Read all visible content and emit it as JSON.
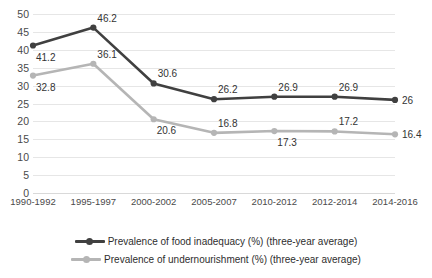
{
  "chart_data": {
    "type": "line",
    "title": "",
    "xlabel": "",
    "ylabel": "",
    "ylim": [
      0,
      50
    ],
    "ystep": 5,
    "grid": true,
    "legend_position": "bottom",
    "yticks": [
      "50",
      "45",
      "40",
      "35",
      "30",
      "25",
      "20",
      "15",
      "10",
      "5",
      "0"
    ],
    "categories": [
      "1990-1992",
      "1995-1997",
      "2000-2002",
      "2005-2007",
      "2010-2012",
      "2012-2014",
      "2014-2016"
    ],
    "series": [
      {
        "name": "Prevalence of food inadequacy (%) (three-year average)",
        "color": "#404040",
        "values": [
          41.2,
          46.2,
          30.6,
          26.2,
          26.9,
          26.9,
          26
        ],
        "labels": [
          "41.2",
          "46.2",
          "30.6",
          "26.2",
          "26.9",
          "26.9",
          "26"
        ],
        "label_positions": [
          "below",
          "above",
          "above",
          "above",
          "above",
          "above",
          "right"
        ]
      },
      {
        "name": "Prevalence of undernourishment (%) (three-year average)",
        "color": "#b5b5b5",
        "values": [
          32.8,
          36.1,
          20.6,
          16.8,
          17.3,
          17.2,
          16.4
        ],
        "labels": [
          "32.8",
          "36.1",
          "20.6",
          "16.8",
          "17.3",
          "17.2",
          "16.4"
        ],
        "label_positions": [
          "below",
          "above",
          "below",
          "above",
          "below",
          "above",
          "right"
        ]
      }
    ]
  }
}
